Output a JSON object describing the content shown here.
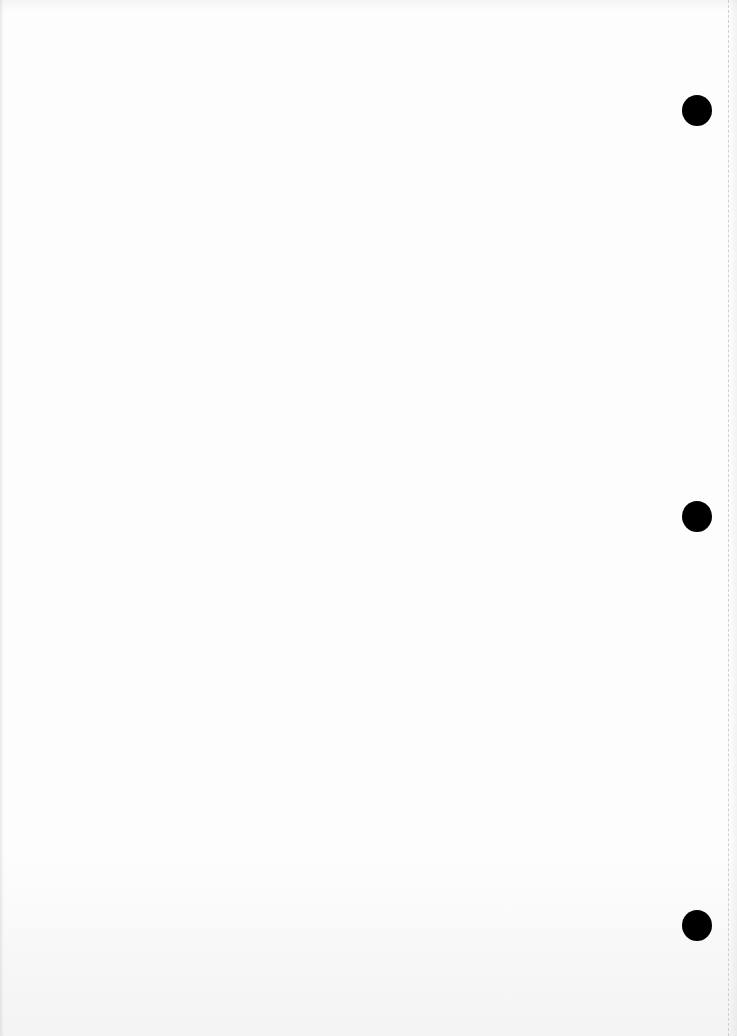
{
  "document": {
    "type": "blank-punched-page",
    "text_content": "",
    "background_color": "#fdfdfd",
    "hole_color": "#000000",
    "margin_line": {
      "style": "dashed",
      "x": 728,
      "color": "#cfcfcf"
    },
    "punch_holes": [
      {
        "id": "top",
        "cx": 697,
        "cy": 110,
        "diameter": 30
      },
      {
        "id": "middle",
        "cx": 697,
        "cy": 516,
        "diameter": 30
      },
      {
        "id": "bottom",
        "cx": 697,
        "cy": 925,
        "diameter": 30
      }
    ]
  }
}
